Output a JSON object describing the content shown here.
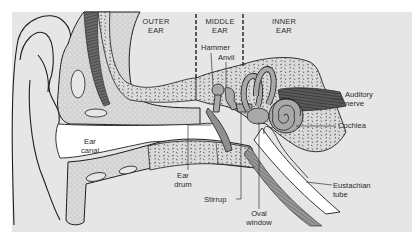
{
  "diagram": {
    "colors": {
      "panel": "#e6e6e6",
      "background": "#ffffff",
      "bone": "#dcdcdc",
      "ossicle": "#a9a9a9",
      "muscle": "#555555",
      "line": "#1e1e1e",
      "canal": "#ffffff"
    },
    "regions": [
      {
        "line1": "OUTER",
        "line2": "EAR"
      },
      {
        "line1": "MIDDLE",
        "line2": "EAR"
      },
      {
        "line1": "INNER",
        "line2": "EAR"
      }
    ],
    "labels": {
      "hammer": "Hammer",
      "anvil": "Anvil",
      "auditory_nerve_1": "Auditory",
      "auditory_nerve_2": "nerve",
      "cochlea": "Cochlea",
      "ear_canal_1": "Ear",
      "ear_canal_2": "canal",
      "ear_drum_1": "Ear",
      "ear_drum_2": "drum",
      "stirrup": "Stirrup",
      "oval_window_1": "Oval",
      "oval_window_2": "window",
      "eustachian_tube_1": "Eustachian",
      "eustachian_tube_2": "tube"
    }
  }
}
